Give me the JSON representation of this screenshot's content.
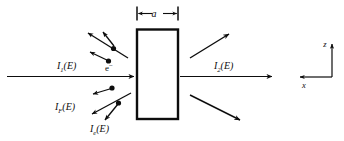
{
  "figure": {
    "type": "physics-schematic",
    "background_color": "#ffffff",
    "line_color": "#0d0d0d",
    "width": 344,
    "height": 141
  },
  "labels": {
    "incident_beam": {
      "symbol": "I",
      "subscript": "1",
      "argument": "(E)",
      "full": "I₁(E)"
    },
    "transmitted_beam": {
      "symbol": "I",
      "subscript": "2",
      "argument": "(E)",
      "full": "I₂(E)"
    },
    "forward_scatter": {
      "symbol": "I",
      "subscript": "F",
      "argument": "(E)",
      "full": "I_F(E)"
    },
    "electron_scatter": {
      "symbol": "I",
      "subscript": "e",
      "argument": "(E)",
      "full": "I_e(E)"
    },
    "electron": {
      "symbol": "e",
      "superscript": "−",
      "full": "e⁻"
    },
    "thickness": {
      "symbol": "a",
      "full": "a"
    }
  },
  "axes": {
    "vertical": {
      "label": "z",
      "direction": "up"
    },
    "horizontal": {
      "label": "x",
      "direction": "left"
    }
  },
  "slab": {
    "name": "sample-slab",
    "thickness_label": "a",
    "fill": "#ffffff",
    "border": "#0d0d0d"
  },
  "scattered_particles": {
    "upper_left_count": 3,
    "lower_left_count": 3,
    "right_outgoing_count": 2,
    "marker": "filled-circle"
  }
}
